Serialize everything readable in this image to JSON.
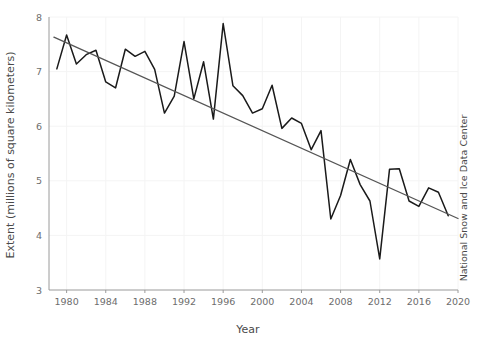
{
  "chart_data": {
    "type": "line",
    "title": "",
    "xlabel": "Year",
    "ylabel": "Extent (millions of square kilometers)",
    "xlim": [
      1978.2,
      2020
    ],
    "ylim": [
      3,
      8
    ],
    "xticks": [
      1980,
      1984,
      1988,
      1992,
      1996,
      2000,
      2004,
      2008,
      2012,
      2016,
      2020
    ],
    "xtick_labels": [
      "1980",
      "1984",
      "1988",
      "1992",
      "1996",
      "2000",
      "2004",
      "2008",
      "2012",
      "2016",
      "2020"
    ],
    "yticks": [
      3,
      4,
      5,
      6,
      7,
      8
    ],
    "ytick_labels": [
      "3",
      "4",
      "5",
      "6",
      "7",
      "8"
    ],
    "grid": true,
    "legend": "none",
    "annotation": "National Snow and Ice Data Center",
    "series": [
      {
        "name": "Arctic sea ice minimum extent",
        "color": "#1a1a1a",
        "x": [
          1979,
          1980,
          1981,
          1982,
          1983,
          1984,
          1985,
          1986,
          1987,
          1988,
          1989,
          1990,
          1991,
          1992,
          1993,
          1994,
          1995,
          1996,
          1997,
          1998,
          1999,
          2000,
          2001,
          2002,
          2003,
          2004,
          2005,
          2006,
          2007,
          2008,
          2009,
          2010,
          2011,
          2012,
          2013,
          2014,
          2015,
          2016,
          2017,
          2018,
          2019
        ],
        "values": [
          7.05,
          7.67,
          7.14,
          7.31,
          7.39,
          6.81,
          6.7,
          7.41,
          7.28,
          7.37,
          7.04,
          6.24,
          6.55,
          7.55,
          6.5,
          7.18,
          6.13,
          7.88,
          6.74,
          6.56,
          6.24,
          6.32,
          6.75,
          5.96,
          6.15,
          6.05,
          5.57,
          5.92,
          4.3,
          4.73,
          5.39,
          4.93,
          4.63,
          3.57,
          5.21,
          5.22,
          4.63,
          4.53,
          4.87,
          4.79,
          4.36
        ]
      },
      {
        "name": "Linear trend",
        "color": "#555555",
        "type": "trend",
        "x": [
          1978.7,
          2020
        ],
        "values": [
          7.63,
          4.31
        ]
      }
    ]
  },
  "axes": {
    "y_label_text": "Extent (millions of square kilometers)",
    "x_label_text": "Year",
    "right_label_text": "National Snow and Ice Data Center"
  }
}
